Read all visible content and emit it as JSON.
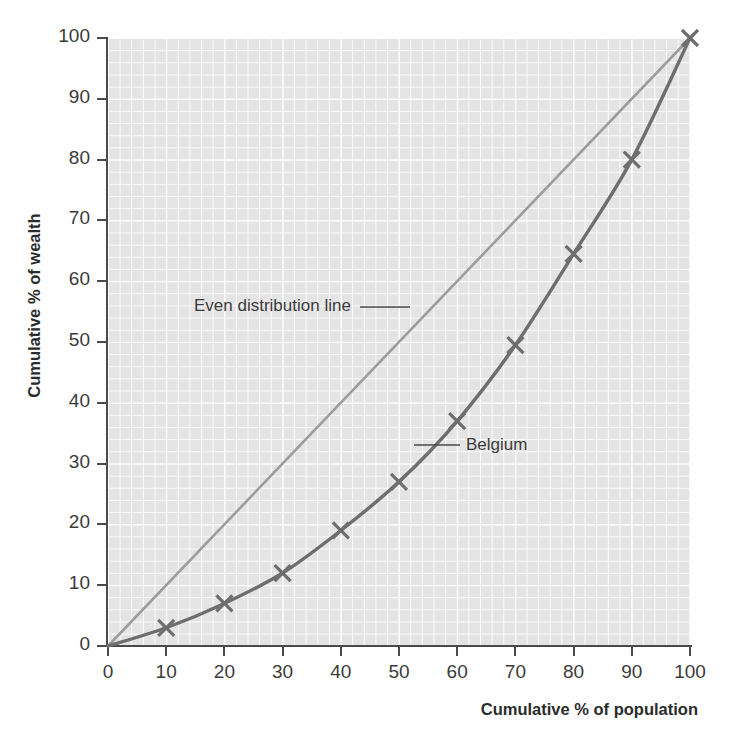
{
  "chart_data": {
    "type": "line",
    "title": "",
    "xlabel": "Cumulative % of population",
    "ylabel": "Cumulative % of wealth",
    "xlim": [
      0,
      100
    ],
    "ylim": [
      0,
      100
    ],
    "xticks": [
      0,
      10,
      20,
      30,
      40,
      50,
      60,
      70,
      80,
      90,
      100
    ],
    "yticks": [
      0,
      10,
      20,
      30,
      40,
      50,
      60,
      70,
      80,
      90,
      100
    ],
    "grid": true,
    "legend_position": "none",
    "series": [
      {
        "name": "Even distribution line",
        "color": "#9d9d9d",
        "marker": "none",
        "x": [
          0,
          100
        ],
        "values": [
          0,
          100
        ]
      },
      {
        "name": "Belgium",
        "color": "#6e6e6e",
        "marker": "x",
        "x": [
          0,
          10,
          20,
          30,
          40,
          50,
          60,
          70,
          80,
          90,
          100
        ],
        "values": [
          0,
          3,
          7,
          12,
          19,
          27,
          37,
          49.5,
          64.5,
          80,
          100
        ]
      }
    ],
    "annotations": [
      {
        "text": "Even distribution line",
        "x": 16,
        "y": 57
      },
      {
        "text": "Belgium",
        "x": 63,
        "y": 33
      }
    ]
  },
  "axes": {
    "y_title": "Cumulative % of wealth",
    "x_title": "Cumulative % of population",
    "y_tick_labels": [
      "100",
      "90",
      "80",
      "70",
      "60",
      "50",
      "40",
      "30",
      "20",
      "10",
      "0"
    ],
    "x_tick_labels": [
      "0",
      "10",
      "20",
      "30",
      "40",
      "50",
      "60",
      "70",
      "80",
      "90",
      "100"
    ]
  },
  "annotations": {
    "even_line": "Even distribution line",
    "belgium": "Belgium"
  },
  "title": {
    "text": ""
  },
  "colors": {
    "even_line": "#9d9d9d",
    "belgium_line": "#6e6e6e",
    "grid_background": "#e4e4e4",
    "gridline": "#ffffff",
    "axis": "#4a4a4a",
    "text": "#3b3b3b"
  }
}
